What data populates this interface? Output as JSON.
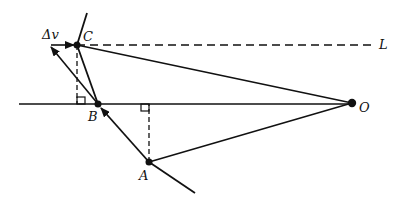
{
  "diagram": {
    "labels": {
      "delta_v": "Δv",
      "C": "C",
      "B": "B",
      "A": "A",
      "O": "O",
      "L": "L"
    },
    "points": {
      "A": [
        149,
        162
      ],
      "B": [
        98,
        104
      ],
      "C": [
        77,
        45
      ],
      "O": [
        352,
        103
      ]
    },
    "colors": {
      "ink": "#111111",
      "background": "#ffffff"
    }
  }
}
